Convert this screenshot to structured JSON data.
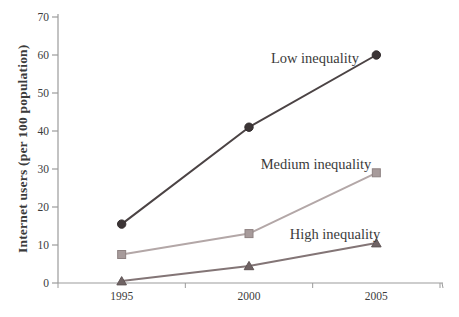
{
  "chart_data": {
    "type": "line",
    "title": "",
    "xlabel": "",
    "ylabel": "Internet users (per 100 population)",
    "categories": [
      "1995",
      "2000",
      "2005"
    ],
    "ylim": [
      0,
      70
    ],
    "yticks": [
      0,
      10,
      20,
      30,
      40,
      50,
      60,
      70
    ],
    "grid": false,
    "legend_position": "inline-annotations",
    "axis_color": "#9b9b9b",
    "text_color": "#3b3b3b",
    "series": [
      {
        "name": "Low inequality",
        "marker": "circle",
        "line_color": "#4b4344",
        "marker_fill": "#3c3536",
        "marker_stroke": "#332d2e",
        "values": [
          15.5,
          41,
          60
        ],
        "label_x": 315,
        "label_y": 63
      },
      {
        "name": "Medium inequality",
        "marker": "square",
        "line_color": "#b3a7a7",
        "marker_fill": "#a79b9b",
        "marker_stroke": "#8e8282",
        "values": [
          7.5,
          13,
          29
        ],
        "label_x": 316,
        "label_y": 169
      },
      {
        "name": "High inequality",
        "marker": "triangle",
        "line_color": "#837576",
        "marker_fill": "#6f6364",
        "marker_stroke": "#5f5455",
        "values": [
          0.5,
          4.5,
          10.5
        ],
        "label_x": 335,
        "label_y": 239
      }
    ]
  }
}
